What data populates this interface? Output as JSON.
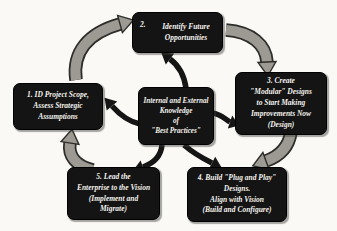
{
  "diagram": {
    "background_color": "#faf9f6",
    "box_color": "#141414",
    "box_text_color": "#f5f3ee",
    "gray_arrow_color": "#9c9a92",
    "arrow_outline_color": "#2e2d29",
    "black_arrow_color": "#151515",
    "center": {
      "lines": [
        "Internal and External",
        "Knowledge",
        "of",
        "\"Best Practices\""
      ]
    },
    "steps": [
      {
        "key": "step-1",
        "lines": [
          "1. ID Project Scope,",
          "Assess Strategic",
          "Assumptions"
        ]
      },
      {
        "key": "step-2",
        "number": "2.",
        "lines": [
          "Identify Future",
          "Opportunities"
        ]
      },
      {
        "key": "step-3",
        "lines": [
          "3. Create",
          "\"Modular\" Designs",
          "to Start Making",
          "Improvements Now",
          "(Design)"
        ]
      },
      {
        "key": "step-4",
        "lines": [
          "4. Build \"Plug and Play\"",
          "Designs.",
          "Align with Vision",
          "(Build and Configure)"
        ]
      },
      {
        "key": "step-5",
        "lines": [
          "5. Lead the",
          "Enterprise to the Vision",
          "(Implement and",
          "Migrate)"
        ]
      }
    ],
    "arrows": {
      "outer_cycle": [
        "step1-to-step2",
        "step2-to-step3",
        "step3-to-step4",
        "step5-to-step1"
      ],
      "from_center": [
        "center-to-step1",
        "center-to-step2",
        "center-to-step3",
        "center-to-step4",
        "center-to-step5"
      ]
    }
  }
}
